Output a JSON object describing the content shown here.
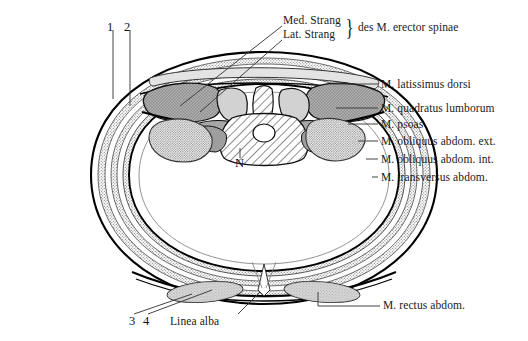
{
  "figure": {
    "colors": {
      "outline": "#000000",
      "muscle_dark": "#9a9a9a",
      "muscle_light": "#d8d8d8",
      "stipple": "#c9c9c9",
      "hatch": "#e6e6e6",
      "leader": "#3a3a3a",
      "text": "#1a1a1a",
      "background": "#ffffff"
    }
  },
  "labels": {
    "top_numbers": [
      {
        "id": "marker-1",
        "text": "1",
        "x": 110,
        "y": 22
      },
      {
        "id": "marker-2",
        "text": "2",
        "x": 127,
        "y": 22
      }
    ],
    "bottom_numbers": [
      {
        "id": "marker-3",
        "text": "3",
        "x": 131,
        "y": 318
      },
      {
        "id": "marker-4",
        "text": "4",
        "x": 145,
        "y": 318
      }
    ],
    "erector_spinae": {
      "line_1": "Med. Strang",
      "line_2": "Lat. Strang",
      "brace": "}",
      "group_text": "des M. erector spinae"
    },
    "nerve_marker": "N",
    "linea_alba": "Linea alba",
    "right_side": [
      {
        "id": "latissimus-dorsi",
        "text": "M. latissimus dorsi",
        "y": 84
      },
      {
        "id": "quadratus-lumborum",
        "text": "M. quadratus lumborum",
        "y": 108
      },
      {
        "id": "psoas",
        "text": "M. psoas",
        "y": 124
      },
      {
        "id": "obliquus-abdom-ext",
        "text": "M. obliquus abdom. ext.",
        "y": 141
      },
      {
        "id": "obliquus-abdom-int",
        "text": "M. obliquus abdom. int.",
        "y": 159
      },
      {
        "id": "transversus-abdom",
        "text": "M. transversus abdom.",
        "y": 177
      }
    ],
    "bottom_right": {
      "id": "rectus-abdom",
      "text": "M. rectus abdom.",
      "x": 383,
      "y": 305
    }
  }
}
